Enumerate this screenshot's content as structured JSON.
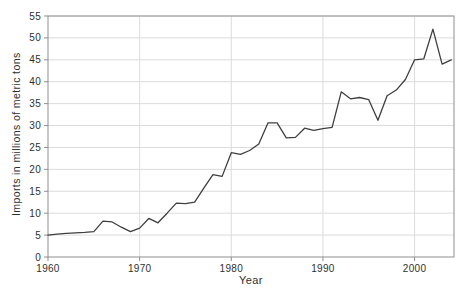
{
  "chart_data": {
    "type": "line",
    "title": "",
    "xlabel": "Year",
    "ylabel": "Imports in millions of metric tons",
    "x": [
      1960,
      1961,
      1962,
      1963,
      1964,
      1965,
      1966,
      1967,
      1968,
      1969,
      1970,
      1971,
      1972,
      1973,
      1974,
      1975,
      1976,
      1977,
      1978,
      1979,
      1980,
      1981,
      1982,
      1983,
      1984,
      1985,
      1986,
      1987,
      1988,
      1989,
      1990,
      1991,
      1992,
      1993,
      1994,
      1995,
      1996,
      1997,
      1998,
      1999,
      2000,
      2001,
      2002,
      2003,
      2004
    ],
    "series": [
      {
        "name": "Imports",
        "values": [
          5.0,
          5.2,
          5.4,
          5.5,
          5.6,
          5.8,
          8.2,
          8.0,
          6.8,
          5.8,
          6.6,
          8.8,
          7.8,
          10.0,
          12.3,
          12.2,
          12.5,
          15.7,
          18.8,
          18.4,
          23.8,
          23.4,
          24.3,
          25.8,
          30.6,
          30.6,
          27.2,
          27.3,
          29.4,
          28.9,
          29.3,
          29.6,
          37.7,
          36.1,
          36.4,
          35.9,
          31.2,
          36.8,
          38.1,
          40.5,
          45.0,
          45.2,
          52.0,
          44.0,
          45.0
        ]
      }
    ],
    "xlim": [
      1960,
      2004.3
    ],
    "ylim": [
      0,
      55
    ],
    "x_ticks": [
      "1960",
      "1970",
      "1980",
      "1990",
      "2000"
    ],
    "x_tick_values": [
      1960,
      1970,
      1980,
      1990,
      2000
    ],
    "y_ticks": [
      "0",
      "5",
      "10",
      "15",
      "20",
      "25",
      "30",
      "35",
      "40",
      "45",
      "50",
      "55"
    ],
    "y_tick_values": [
      0,
      5,
      10,
      15,
      20,
      25,
      30,
      35,
      40,
      45,
      50,
      55
    ],
    "grid": true,
    "legend": "none",
    "colors": {
      "line": "#3f3f3f",
      "grid": "#dcdcdc",
      "axis": "#8f8f8f",
      "text": "#2f2f2f"
    }
  }
}
